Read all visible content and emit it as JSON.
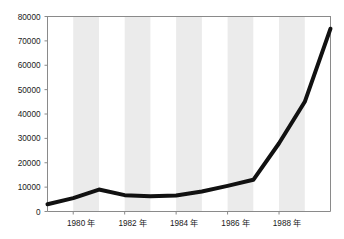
{
  "chart_data": {
    "type": "line",
    "title": "",
    "xlabel": "",
    "ylabel": "",
    "x": [
      1979,
      1980,
      1981,
      1982,
      1983,
      1984,
      1985,
      1986,
      1987,
      1988,
      1989,
      1990
    ],
    "values": [
      3000,
      5500,
      9000,
      6700,
      6300,
      6600,
      8200,
      10500,
      13000,
      28000,
      45000,
      75000
    ],
    "series": [
      {
        "name": "series-1",
        "values": [
          3000,
          5500,
          9000,
          6700,
          6300,
          6600,
          8200,
          10500,
          13000,
          28000,
          45000,
          75000
        ]
      }
    ],
    "xlim": [
      1979,
      1990
    ],
    "ylim": [
      0,
      80000
    ],
    "ytick_values": [
      0,
      10000,
      20000,
      30000,
      40000,
      50000,
      60000,
      70000,
      80000
    ],
    "ytick_labels": [
      "0",
      "10000",
      "20000",
      "30000",
      "40000",
      "50000",
      "60000",
      "70000",
      "80000"
    ],
    "xtick_values": [
      1980,
      1982,
      1984,
      1986,
      1988
    ],
    "xtick_labels": [
      "1980 年",
      "1982 年",
      "1984 年",
      "1986 年",
      "1988 年"
    ],
    "grid": false,
    "legend": null,
    "legend_position": "none",
    "band_shading": {
      "enabled": true,
      "note": "alternating vertical gray stripes each spanning one year starting at 1980",
      "band_starts": [
        1980,
        1982,
        1984,
        1986,
        1988
      ],
      "band_width_years": 1,
      "color": "#ebebeb"
    },
    "line_color": "#111111",
    "line_width": 4,
    "axis_color": "#808080",
    "background_color": "#ffffff"
  }
}
